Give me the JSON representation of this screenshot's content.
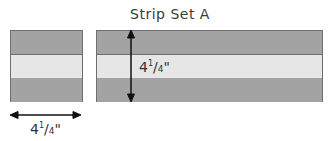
{
  "diagram": {
    "title": "Strip Set A",
    "colors": {
      "dark_strip": "#a3a3a3",
      "light_strip": "#e6e6e6",
      "outline": "#6e6e6e",
      "arrow": "#111111"
    },
    "blocks": [
      {
        "name": "cut-segment",
        "strips": [
          "dark",
          "light",
          "dark"
        ]
      },
      {
        "name": "strip-set",
        "strips": [
          "dark",
          "light",
          "dark"
        ]
      }
    ],
    "dimensions": {
      "height": {
        "whole": "4",
        "num": "1",
        "den": "4",
        "unit": "\""
      },
      "width": {
        "whole": "4",
        "num": "1",
        "den": "4",
        "unit": "\""
      }
    }
  }
}
